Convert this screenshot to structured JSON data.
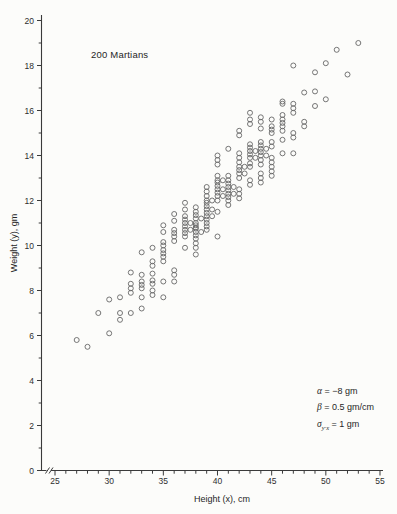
{
  "figure": {
    "title": "200 Martians",
    "xlabel": "Height (x), cm",
    "ylabel": "Weight (y), gm"
  },
  "annotations": {
    "alpha": {
      "symbol": "α",
      "sub": "",
      "value": " = −8 gm"
    },
    "beta": {
      "symbol": "β",
      "sub": "",
      "value": " = 0.5 gm/cm"
    },
    "sigma": {
      "symbol": "σ",
      "sub": "y·x",
      "value": " = 1 gm"
    }
  },
  "colors": {
    "ink": "#2e2e2e",
    "axis": "#3a3a3a",
    "point_stroke": "#676767",
    "background": "#fcfcfa"
  },
  "chart_data": {
    "type": "scatter",
    "title": "200 Martians",
    "xlabel": "Height (x), cm",
    "ylabel": "Weight (y), gm",
    "xlim": [
      25,
      55
    ],
    "ylim": [
      0,
      20
    ],
    "x_axis_break_before_first_tick": true,
    "x_ticks_labeled": [
      25,
      30,
      35,
      40,
      45,
      50,
      55
    ],
    "x_minor_tick_step": 1,
    "y_ticks_labeled": [
      0,
      2,
      4,
      6,
      8,
      10,
      12,
      14,
      16,
      18,
      20
    ],
    "y_minor_tick_step": 1,
    "grid": false,
    "legend": false,
    "n_points": 200,
    "regression_annotation": {
      "alpha_gm": -8,
      "beta_gm_per_cm": 0.5,
      "sigma_yx_gm": 1
    },
    "columns": {
      "27": [
        5.8
      ],
      "28": [
        5.5
      ],
      "29": [
        7.0
      ],
      "30": [
        6.1,
        7.6
      ],
      "31": [
        6.7,
        7.0,
        7.7
      ],
      "32": [
        7.0,
        7.9,
        8.1,
        8.3,
        8.8
      ],
      "33": [
        7.2,
        7.7,
        8.1,
        8.25,
        8.4,
        8.7,
        9.7
      ],
      "34": [
        7.8,
        8.0,
        8.3,
        8.45,
        8.75,
        9.1,
        9.3,
        9.9
      ],
      "35": [
        7.7,
        8.4,
        9.3,
        9.5,
        9.65,
        9.8,
        10.0,
        10.15,
        10.6,
        10.9
      ],
      "36": [
        8.4,
        8.7,
        8.9,
        10.2,
        10.4,
        10.55,
        10.7,
        11.1,
        11.4
      ],
      "37": [
        9.9,
        10.4,
        10.55,
        10.7,
        10.7,
        10.85,
        11.0,
        11.0,
        11.15,
        11.3,
        11.6,
        11.9
      ],
      "38": [
        9.6,
        9.9,
        10.1,
        10.3,
        10.45,
        10.6,
        10.6,
        10.75,
        10.8,
        10.9,
        11.0,
        11.2,
        11.2,
        11.35,
        11.5,
        11.7
      ],
      "39": [
        10.7,
        10.85,
        11.0,
        11.15,
        11.3,
        11.3,
        11.45,
        11.6,
        11.6,
        11.75,
        11.9,
        12.0,
        12.0,
        12.2,
        12.4,
        12.6
      ],
      "40": [
        10.4,
        11.5,
        12.0,
        12.2,
        12.2,
        12.35,
        12.5,
        12.5,
        12.65,
        12.8,
        12.9,
        12.9,
        13.1,
        13.6,
        13.8,
        14.0
      ],
      "41": [
        11.8,
        12.0,
        12.15,
        12.3,
        12.3,
        12.45,
        12.6,
        12.6,
        12.75,
        12.9,
        13.1,
        14.3
      ],
      "42": [
        12.1,
        12.3,
        12.5,
        13.0,
        13.2,
        13.2,
        13.35,
        13.5,
        13.5,
        13.7,
        13.9,
        14.1,
        14.9,
        15.1
      ],
      "43": [
        12.7,
        12.9,
        13.5,
        13.65,
        13.9,
        13.9,
        14.05,
        14.2,
        14.2,
        14.35,
        14.5,
        15.4,
        15.6,
        15.9
      ],
      "44": [
        12.8,
        13.0,
        13.2,
        13.6,
        13.8,
        14.0,
        14.0,
        14.15,
        14.3,
        14.3,
        14.45,
        14.6,
        15.2,
        15.5,
        15.7
      ],
      "45": [
        13.1,
        13.3,
        13.5,
        13.7,
        13.9,
        14.4,
        14.6,
        15.0,
        15.15,
        15.3,
        15.6
      ],
      "46": [
        14.1,
        14.7,
        15.1,
        15.3,
        15.45,
        15.6,
        15.8,
        16.3,
        16.4
      ],
      "47": [
        14.1,
        14.8,
        15.0,
        15.9,
        16.1,
        16.3,
        18.0
      ],
      "48": [
        15.3,
        15.5,
        16.8
      ],
      "49": [
        16.2,
        16.85,
        17.7
      ],
      "50": [
        16.5,
        18.1
      ],
      "51": [
        18.7
      ],
      "52": [
        17.6
      ],
      "53": [
        19.0
      ]
    }
  }
}
